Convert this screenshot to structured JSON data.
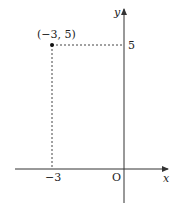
{
  "diagram": {
    "type": "coordinate-plane",
    "point": {
      "x": -3,
      "y": 5,
      "label": "(−3, 5)"
    },
    "axes": {
      "x_label": "x",
      "y_label": "y",
      "origin_label": "O"
    },
    "ticks": {
      "x_tick_label": "−3",
      "y_tick_label": "5"
    },
    "colors": {
      "axis": "#333333",
      "guide": "#444444",
      "point": "#111111"
    }
  }
}
